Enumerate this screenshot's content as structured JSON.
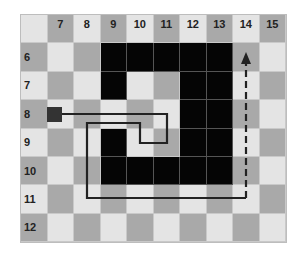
{
  "columns": [
    "7",
    "8",
    "9",
    "10",
    "11",
    "12",
    "13",
    "14",
    "15"
  ],
  "rows": [
    "6",
    "7",
    "8",
    "9",
    "10",
    "11",
    "12"
  ],
  "walls": [
    [
      6,
      9
    ],
    [
      6,
      10
    ],
    [
      6,
      11
    ],
    [
      6,
      12
    ],
    [
      6,
      13
    ],
    [
      7,
      9
    ],
    [
      7,
      12
    ],
    [
      7,
      13
    ],
    [
      8,
      12
    ],
    [
      8,
      13
    ],
    [
      9,
      9
    ],
    [
      9,
      12
    ],
    [
      9,
      13
    ],
    [
      10,
      9
    ],
    [
      10,
      10
    ],
    [
      10,
      11
    ],
    [
      10,
      12
    ],
    [
      10,
      13
    ]
  ],
  "start": {
    "row": 8,
    "col": 7
  },
  "path": {
    "solid_points": [
      [
        57,
        114
      ],
      [
        167,
        114
      ],
      [
        167,
        143
      ],
      [
        140,
        143
      ],
      [
        140,
        123
      ],
      [
        87,
        123
      ],
      [
        87,
        198
      ],
      [
        246,
        198
      ]
    ],
    "dashed_points": [
      [
        246,
        198
      ],
      [
        246,
        62
      ]
    ],
    "arrow_tip": [
      246,
      52
    ]
  },
  "colors": {
    "light": "#e4e4e4",
    "dark": "#a9a9a9",
    "wall": "#050505",
    "path": "#222222"
  }
}
